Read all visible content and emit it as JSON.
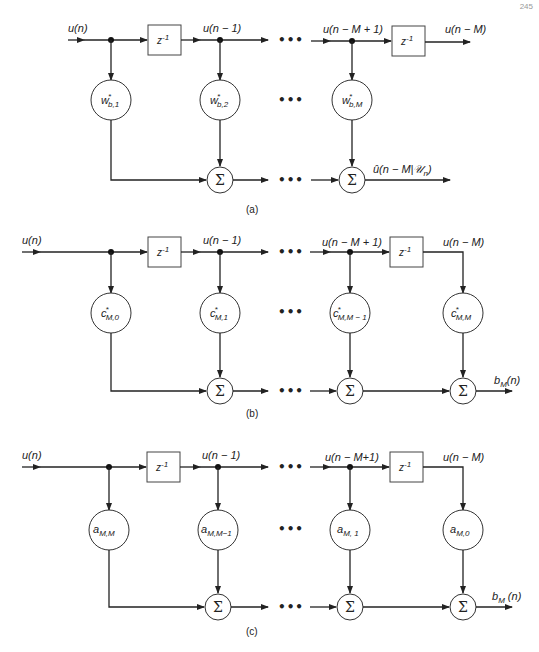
{
  "page_number": "245",
  "panels": [
    {
      "caption": "(a)",
      "input_label": "u(n)",
      "delay_label": "z",
      "delay_exp": "-1",
      "tap1_label": "u(n − 1)",
      "tapM1_label": "u(n − M + 1)",
      "tapM_label": "u(n − M)",
      "weights": [
        {
          "base": "w",
          "sup": "*",
          "sub": "b,1"
        },
        {
          "base": "w",
          "sup": "*",
          "sub": "b,2"
        },
        {
          "base": "w",
          "sup": "*",
          "sub": "b,M"
        }
      ],
      "sum_symbol": "Σ",
      "output_label": "û(n − M|𝒰",
      "output_sub": "n",
      "output_close": ")",
      "ellipsis": "•••"
    },
    {
      "caption": "(b)",
      "input_label": "u(n)",
      "delay_label": "z",
      "delay_exp": "-1",
      "tap1_label": "u(n − 1)",
      "tapM1_label": "u(n − M + 1)",
      "tapM_label": "u(n − M)",
      "weights": [
        {
          "base": "c",
          "sup": "*",
          "sub": "M,0"
        },
        {
          "base": "c",
          "sup": "*",
          "sub": "M,1"
        },
        {
          "base": "c",
          "sup": "*",
          "sub": "M,M − 1"
        },
        {
          "base": "c",
          "sup": "*",
          "sub": "M,M"
        }
      ],
      "sum_symbol": "Σ",
      "output_label": "b",
      "output_sub": "M",
      "output_close": "(n)",
      "ellipsis": "•••"
    },
    {
      "caption": "(c)",
      "input_label": "u(n)",
      "delay_label": "z",
      "delay_exp": "-1",
      "tap1_label": "u(n − 1)",
      "tapM1_label": "u(n − M+1)",
      "tapM_label": "u(n − M)",
      "weights": [
        {
          "base": "a",
          "sup": "",
          "sub": "M,M"
        },
        {
          "base": "a",
          "sup": "",
          "sub": "M,M−1"
        },
        {
          "base": "a",
          "sup": "",
          "sub": "M, 1"
        },
        {
          "base": "a",
          "sup": "",
          "sub": "M,0"
        }
      ],
      "sum_symbol": "Σ",
      "output_label": "b",
      "output_sub": "M",
      "output_close": " (n)",
      "ellipsis": "•••"
    }
  ]
}
